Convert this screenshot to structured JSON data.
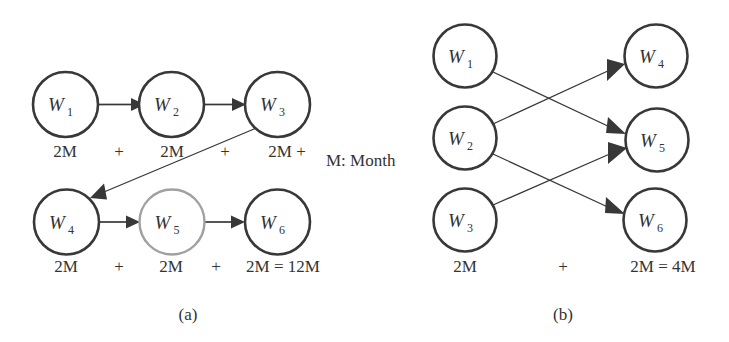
{
  "figure": {
    "background_color": "#ffffff",
    "stroke_color": "#383838",
    "muted_stroke_color": "#a0a0a0",
    "text_color": "#333333",
    "legend": "M: Month",
    "panels": [
      {
        "id": "a",
        "caption": "(a)",
        "layout": "sequential-chain",
        "nodes": [
          {
            "id": "w1",
            "base": "W",
            "sub": "1",
            "cx": 65.5,
            "cy": 104.5,
            "r": 32.5,
            "muted": false
          },
          {
            "id": "w2",
            "base": "W",
            "sub": "2",
            "cx": 171.5,
            "cy": 104.5,
            "r": 32.5,
            "muted": false
          },
          {
            "id": "w3",
            "base": "W",
            "sub": "3",
            "cx": 277.5,
            "cy": 104.5,
            "r": 32.5,
            "muted": false
          },
          {
            "id": "w4",
            "base": "W",
            "sub": "4",
            "cx": 66.5,
            "cy": 222.0,
            "r": 32.5,
            "muted": false
          },
          {
            "id": "w5",
            "base": "W",
            "sub": "5",
            "cx": 172.0,
            "cy": 222.0,
            "r": 32.5,
            "muted": true
          },
          {
            "id": "w6",
            "base": "W",
            "sub": "6",
            "cx": 277.5,
            "cy": 222.0,
            "r": 32.5,
            "muted": false
          }
        ],
        "edges": [
          {
            "from": "w1",
            "to": "w2",
            "kind": "horizontal"
          },
          {
            "from": "w2",
            "to": "w3",
            "kind": "horizontal"
          },
          {
            "from": "w3",
            "to": "w4",
            "kind": "diagonal"
          },
          {
            "from": "w4",
            "to": "w5",
            "kind": "horizontal"
          },
          {
            "from": "w5",
            "to": "w6",
            "kind": "horizontal"
          }
        ],
        "cost_row_top": [
          {
            "text": "2M",
            "x": 65,
            "y": 157
          },
          {
            "text": "+",
            "x": 119,
            "y": 157
          },
          {
            "text": "2M",
            "x": 172,
            "y": 157
          },
          {
            "text": "+",
            "x": 225,
            "y": 157
          },
          {
            "text": "2M +",
            "x": 287,
            "y": 157
          }
        ],
        "cost_row_bottom": [
          {
            "text": "2M",
            "x": 66,
            "y": 272
          },
          {
            "text": "+",
            "x": 119,
            "y": 272
          },
          {
            "text": "2M",
            "x": 171,
            "y": 272
          },
          {
            "text": "+",
            "x": 216,
            "y": 272
          },
          {
            "text": "2M = 12M",
            "x": 283,
            "y": 272
          }
        ],
        "total": "12M"
      },
      {
        "id": "b",
        "caption": "(b)",
        "layout": "parallel-crossing",
        "nodes": [
          {
            "id": "w1",
            "base": "W",
            "sub": "1",
            "cx": 465.0,
            "cy": 56.0,
            "r": 31.5,
            "muted": false
          },
          {
            "id": "w2",
            "base": "W",
            "sub": "2",
            "cx": 465.0,
            "cy": 138.0,
            "r": 31.5,
            "muted": false
          },
          {
            "id": "w3",
            "base": "W",
            "sub": "3",
            "cx": 465.0,
            "cy": 220.0,
            "r": 31.5,
            "muted": false
          },
          {
            "id": "w4",
            "base": "W",
            "sub": "4",
            "cx": 656.0,
            "cy": 56.0,
            "r": 31.5,
            "muted": false
          },
          {
            "id": "w5",
            "base": "W",
            "sub": "5",
            "cx": 657.0,
            "cy": 140.0,
            "r": 31.5,
            "muted": false
          },
          {
            "id": "w6",
            "base": "W",
            "sub": "6",
            "cx": 655.0,
            "cy": 220.0,
            "r": 31.5,
            "muted": false
          }
        ],
        "edges": [
          {
            "from": "w1",
            "to": "w5",
            "kind": "diagonal"
          },
          {
            "from": "w2",
            "to": "w4",
            "kind": "diagonal"
          },
          {
            "from": "w2",
            "to": "w6",
            "kind": "diagonal"
          },
          {
            "from": "w3",
            "to": "w5",
            "kind": "diagonal"
          }
        ],
        "cost_row_bottom": [
          {
            "text": "2M",
            "x": 465,
            "y": 272
          },
          {
            "text": "+",
            "x": 563,
            "y": 272
          },
          {
            "text": "2M = 4M",
            "x": 663,
            "y": 272
          }
        ],
        "total": "4M"
      }
    ],
    "legend_position": {
      "x": 326,
      "y": 166
    },
    "caption_positions": [
      {
        "id": "a",
        "x": 188,
        "y": 320
      },
      {
        "id": "b",
        "x": 563,
        "y": 320
      }
    ]
  }
}
